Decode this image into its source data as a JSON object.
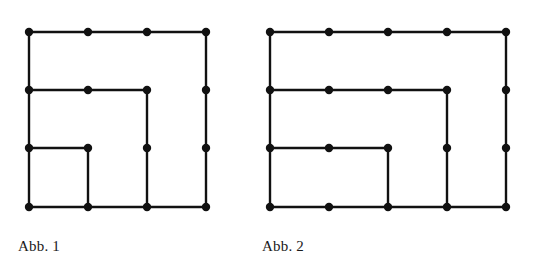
{
  "page": {
    "background_color": "#ffffff",
    "ink_color": "#111111",
    "width": 538,
    "height": 276
  },
  "figures": [
    {
      "id": "figure-1",
      "caption": "Abb. 1",
      "grid": {
        "cols": 4,
        "rows": 4,
        "x_spacing": 59,
        "y_spacing": 58,
        "origin_x": 29,
        "origin_y": 32
      },
      "dot_radius": 4.2,
      "stroke_width": 2.4,
      "dots": [
        {
          "col": 1,
          "row": 1,
          "x": 29,
          "y": 32
        },
        {
          "col": 2,
          "row": 1,
          "x": 88,
          "y": 32
        },
        {
          "col": 3,
          "row": 1,
          "x": 147,
          "y": 32
        },
        {
          "col": 4,
          "row": 1,
          "x": 206,
          "y": 32
        },
        {
          "col": 1,
          "row": 2,
          "x": 29,
          "y": 90
        },
        {
          "col": 2,
          "row": 2,
          "x": 88,
          "y": 90
        },
        {
          "col": 3,
          "row": 2,
          "x": 147,
          "y": 90
        },
        {
          "col": 4,
          "row": 2,
          "x": 206,
          "y": 90
        },
        {
          "col": 1,
          "row": 3,
          "x": 29,
          "y": 148
        },
        {
          "col": 2,
          "row": 3,
          "x": 88,
          "y": 148
        },
        {
          "col": 3,
          "row": 3,
          "x": 147,
          "y": 148
        },
        {
          "col": 4,
          "row": 3,
          "x": 206,
          "y": 148
        },
        {
          "col": 1,
          "row": 4,
          "x": 29,
          "y": 207
        },
        {
          "col": 2,
          "row": 4,
          "x": 88,
          "y": 207
        },
        {
          "col": 3,
          "row": 4,
          "x": 147,
          "y": 207
        },
        {
          "col": 4,
          "row": 4,
          "x": 206,
          "y": 207
        }
      ],
      "edges": [
        {
          "name": "top-border",
          "x1": 29,
          "y1": 32,
          "x2": 206,
          "y2": 32
        },
        {
          "name": "left-border",
          "x1": 29,
          "y1": 32,
          "x2": 29,
          "y2": 207
        },
        {
          "name": "right-border",
          "x1": 206,
          "y1": 32,
          "x2": 206,
          "y2": 207
        },
        {
          "name": "bottom-border",
          "x1": 29,
          "y1": 207,
          "x2": 206,
          "y2": 207
        },
        {
          "name": "row2-inner-horiz",
          "x1": 29,
          "y1": 90,
          "x2": 147,
          "y2": 90
        },
        {
          "name": "col3-inner-vert",
          "x1": 147,
          "y1": 90,
          "x2": 147,
          "y2": 207
        },
        {
          "name": "row3-inner-horiz",
          "x1": 29,
          "y1": 148,
          "x2": 88,
          "y2": 148
        },
        {
          "name": "col2-inner-vert",
          "x1": 88,
          "y1": 148,
          "x2": 88,
          "y2": 207
        }
      ]
    },
    {
      "id": "figure-2",
      "caption": "Abb. 2",
      "grid": {
        "cols": 5,
        "rows": 4,
        "x_spacing": 59,
        "y_spacing": 58,
        "origin_x": 16,
        "origin_y": 32
      },
      "dot_radius": 4.2,
      "stroke_width": 2.4,
      "dots": [
        {
          "col": 1,
          "row": 1,
          "x": 16,
          "y": 32
        },
        {
          "col": 2,
          "row": 1,
          "x": 75,
          "y": 32
        },
        {
          "col": 3,
          "row": 1,
          "x": 134,
          "y": 32
        },
        {
          "col": 4,
          "row": 1,
          "x": 193,
          "y": 32
        },
        {
          "col": 5,
          "row": 1,
          "x": 252,
          "y": 32
        },
        {
          "col": 1,
          "row": 2,
          "x": 16,
          "y": 90
        },
        {
          "col": 2,
          "row": 2,
          "x": 75,
          "y": 90
        },
        {
          "col": 3,
          "row": 2,
          "x": 134,
          "y": 90
        },
        {
          "col": 4,
          "row": 2,
          "x": 193,
          "y": 90
        },
        {
          "col": 5,
          "row": 2,
          "x": 252,
          "y": 90
        },
        {
          "col": 1,
          "row": 3,
          "x": 16,
          "y": 148
        },
        {
          "col": 2,
          "row": 3,
          "x": 75,
          "y": 148
        },
        {
          "col": 3,
          "row": 3,
          "x": 134,
          "y": 148
        },
        {
          "col": 4,
          "row": 3,
          "x": 193,
          "y": 148
        },
        {
          "col": 5,
          "row": 3,
          "x": 252,
          "y": 148
        },
        {
          "col": 1,
          "row": 4,
          "x": 16,
          "y": 207
        },
        {
          "col": 2,
          "row": 4,
          "x": 75,
          "y": 207
        },
        {
          "col": 3,
          "row": 4,
          "x": 134,
          "y": 207
        },
        {
          "col": 4,
          "row": 4,
          "x": 193,
          "y": 207
        },
        {
          "col": 5,
          "row": 4,
          "x": 252,
          "y": 207
        }
      ],
      "edges": [
        {
          "name": "top-border",
          "x1": 16,
          "y1": 32,
          "x2": 252,
          "y2": 32
        },
        {
          "name": "left-border",
          "x1": 16,
          "y1": 32,
          "x2": 16,
          "y2": 207
        },
        {
          "name": "right-border",
          "x1": 252,
          "y1": 32,
          "x2": 252,
          "y2": 207
        },
        {
          "name": "bottom-border",
          "x1": 16,
          "y1": 207,
          "x2": 252,
          "y2": 207
        },
        {
          "name": "row2-inner-horiz",
          "x1": 16,
          "y1": 90,
          "x2": 193,
          "y2": 90
        },
        {
          "name": "col4-inner-vert",
          "x1": 193,
          "y1": 90,
          "x2": 193,
          "y2": 207
        },
        {
          "name": "row3-inner-horiz",
          "x1": 16,
          "y1": 148,
          "x2": 134,
          "y2": 148
        },
        {
          "name": "col3-inner-vert",
          "x1": 134,
          "y1": 148,
          "x2": 134,
          "y2": 207
        }
      ]
    }
  ]
}
